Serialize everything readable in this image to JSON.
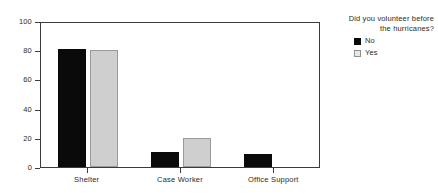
{
  "chart_data": {
    "type": "bar",
    "title": "",
    "xlabel": "",
    "ylabel": "",
    "ylim": [
      0,
      100
    ],
    "yticks": [
      0,
      20,
      40,
      60,
      80,
      100
    ],
    "grid": false,
    "legend_position": "right",
    "legend_title": "Did you volunteer before the hurricanes?",
    "legend_title_lines": [
      "Did you volunteer before",
      "the hurricanes?"
    ],
    "categories": [
      "Shelter",
      "Case Worker",
      "Office Support"
    ],
    "series": [
      {
        "name": "No",
        "color": "#0a0a0a",
        "values": [
          81,
          10,
          9
        ]
      },
      {
        "name": "Yes",
        "color": "#cfcfcf",
        "values": [
          80,
          20,
          0
        ]
      }
    ]
  },
  "axis": {
    "y_tick_labels": [
      "0",
      "20",
      "40",
      "60",
      "80",
      "100"
    ],
    "x_tick_labels": [
      "Shelter",
      "Case Worker",
      "Office Support"
    ]
  },
  "legend": {
    "title_line_1": "Did you volunteer before",
    "title_line_2": "the hurricanes?",
    "entries": [
      {
        "label": "No"
      },
      {
        "label": "Yes"
      }
    ]
  }
}
